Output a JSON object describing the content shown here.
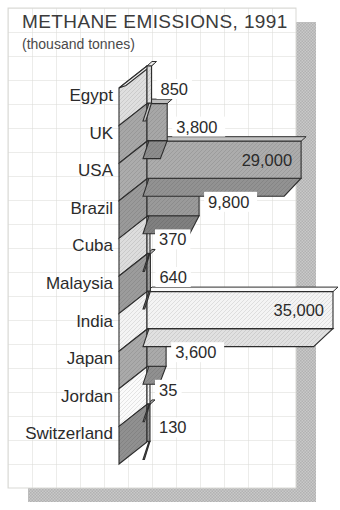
{
  "chart_data": {
    "type": "bar",
    "orientation": "horizontal",
    "title": "METHANE EMISSIONS, 1991",
    "subtitle": "(thousand tonnes)",
    "unit": "thousand tonnes",
    "xlim": [
      0,
      35000
    ],
    "grid": true,
    "legend": "none",
    "style": "3d-slab-bars-with-stacked-axis-wall, gridded card with offset drop shadow",
    "categories": [
      "Egypt",
      "UK",
      "USA",
      "Brazil",
      "Cuba",
      "Malaysia",
      "India",
      "Japan",
      "Jordan",
      "Switzerland"
    ],
    "values": [
      850,
      3800,
      29000,
      9800,
      370,
      640,
      35000,
      3600,
      35,
      130
    ],
    "value_labels": [
      "850",
      "3,800",
      "29,000",
      "9,800",
      "370",
      "640",
      "35,000",
      "3,600",
      "35",
      "130"
    ],
    "label_inside": [
      false,
      false,
      true,
      false,
      false,
      false,
      true,
      false,
      false,
      false
    ],
    "colors": [
      {
        "front": "#dfdfdf",
        "top": "#ededed",
        "bottom": "#c6c6c6"
      },
      {
        "front": "#a7a7a7",
        "top": "#bdbdbd",
        "bottom": "#8d8d8d"
      },
      {
        "front": "#acacac",
        "top": "#c2c2c2",
        "bottom": "#929292"
      },
      {
        "front": "#9a9a9a",
        "top": "#b1b1b1",
        "bottom": "#808080"
      },
      {
        "front": "#dddddd",
        "top": "#ebebeb",
        "bottom": "#c3c3c3"
      },
      {
        "front": "#9c9c9c",
        "top": "#b3b3b3",
        "bottom": "#838383"
      },
      {
        "front": "#f4f4f4",
        "top": "#fbfbfb",
        "bottom": "#e1e1e1"
      },
      {
        "front": "#aaaaaa",
        "top": "#c0c0c0",
        "bottom": "#909090"
      },
      {
        "front": "#fbfbfb",
        "top": "#ffffff",
        "bottom": "#e8e8e8"
      },
      {
        "front": "#909090",
        "top": "#a8a8a8",
        "bottom": "#777777"
      }
    ],
    "ink_color": "#2e2e2e",
    "text_color": "#2b2b2b",
    "grid_color": "#d9d9d5",
    "card_bg": "#ffffff",
    "shadow_dark": "#b2b2b2",
    "shadow_light": "#c9c9c9",
    "wall_cap_color": "#f1f1f1"
  }
}
